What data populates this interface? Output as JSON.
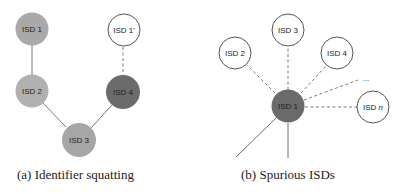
{
  "panels": [
    {
      "id": "a",
      "caption": "(a) Identifier squatting",
      "nodes": [
        {
          "label": "ISD 1",
          "fill": "#a9a9a9",
          "style": "filled"
        },
        {
          "label": "ISD 2",
          "fill": "#b1b1b1",
          "style": "filled"
        },
        {
          "label": "ISD 3",
          "fill": "#a6a6a6",
          "style": "filled"
        },
        {
          "label": "ISD 4",
          "fill": "#6b6b6b",
          "style": "filled"
        },
        {
          "label": "ISD 1'",
          "fill": "#ffffff",
          "style": "outline"
        }
      ],
      "edges": [
        {
          "from": "ISD 1",
          "to": "ISD 2",
          "type": "solid"
        },
        {
          "from": "ISD 2",
          "to": "ISD 3",
          "type": "solid"
        },
        {
          "from": "ISD 3",
          "to": "ISD 4",
          "type": "solid"
        },
        {
          "from": "ISD 4",
          "to": "ISD 1'",
          "type": "dashed"
        }
      ]
    },
    {
      "id": "b",
      "caption": "(b) Spurious ISDs",
      "nodes": [
        {
          "label": "ISD 1",
          "fill": "#6b6b6b",
          "style": "filled"
        },
        {
          "label": "ISD 2",
          "fill": "#ffffff",
          "style": "outline"
        },
        {
          "label": "ISD 3",
          "fill": "#ffffff",
          "style": "outline"
        },
        {
          "label": "ISD 4",
          "fill": "#ffffff",
          "style": "outline"
        },
        {
          "label": "ISD n",
          "label_prefix": "ISD ",
          "label_italic": "n",
          "fill": "#ffffff",
          "style": "outline"
        }
      ],
      "ellipsis": "...",
      "edges": [
        {
          "from": "ISD 1",
          "to": "ISD 2",
          "type": "dashed"
        },
        {
          "from": "ISD 1",
          "to": "ISD 3",
          "type": "dashed"
        },
        {
          "from": "ISD 1",
          "to": "ISD 4",
          "type": "dashed"
        },
        {
          "from": "ISD 1",
          "to": "...",
          "type": "dashed"
        },
        {
          "from": "ISD 1",
          "to": "ISD n",
          "type": "dashed"
        },
        {
          "from": "ISD 1",
          "to": "off-canvas-1",
          "type": "solid"
        },
        {
          "from": "ISD 1",
          "to": "off-canvas-2",
          "type": "solid"
        }
      ]
    }
  ],
  "colors": {
    "edge": "#6e6e6e",
    "outline": "#555555",
    "text": "#222222"
  }
}
